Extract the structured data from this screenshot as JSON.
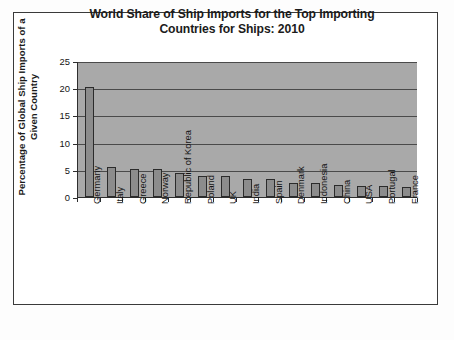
{
  "figure": {
    "frame_border_color": "#3a3a3a",
    "page_background": "#fdfdfd"
  },
  "chart_data": {
    "type": "bar",
    "title": "World Share of Ship Imports for the Top Importing Countries for Ships: 2010",
    "title_line1": "World Share of Ship Imports for the Top Importing",
    "title_line2": "Countries for Ships: 2010",
    "ylabel": "Percentage of Global Ship Imports of a Given Country",
    "ylabel_line1": "Percentage of Global Ship Imports of a",
    "ylabel_line2": "Given Country",
    "xlabel": "",
    "categories": [
      "Germany",
      "Italy",
      "Greece",
      "Norway",
      "Republic of Korea",
      "Poland",
      "UK",
      "India",
      "Spain",
      "Denmark",
      "Indonesia",
      "China",
      "USA",
      "Portugal",
      "France"
    ],
    "values": [
      20.2,
      5.6,
      5.2,
      5.2,
      4.5,
      3.8,
      3.8,
      3.4,
      3.3,
      2.6,
      2.5,
      2.2,
      2.1,
      2.0,
      1.8
    ],
    "ylim": [
      0,
      25
    ],
    "yticks": [
      0,
      5,
      10,
      15,
      20,
      25
    ],
    "ytick_labels": [
      "0",
      "5",
      "10",
      "15",
      "20",
      "25"
    ],
    "grid": true,
    "grid_axis": "y",
    "legend": false,
    "legend_position": "none",
    "plot_background_color": "#a9a9a9",
    "bar_fill_color": "#8c8c8c",
    "bar_edge_color": "#2b2b2b",
    "axis_color": "#2e2e2e",
    "gridline_color": "#4a4a4a"
  }
}
